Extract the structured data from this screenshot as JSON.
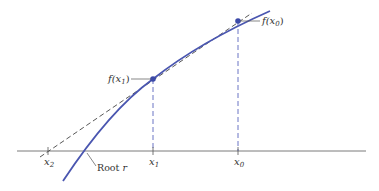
{
  "diagram": {
    "colors": {
      "curve": "#4a56b0",
      "axis": "#7a7a7a",
      "tangent": "#444444",
      "dashed_vertical": "#6b74c4",
      "point": "#3c4aa8",
      "text": "#333333"
    },
    "labels": {
      "f_x0_main": "f(x",
      "f_x0_sub": "0",
      "f_x0_close": ")",
      "f_x1_main": "f(x",
      "f_x1_sub": "1",
      "f_x1_close": ")",
      "x0_main": "x",
      "x0_sub": "0",
      "x1_main": "x",
      "x1_sub": "1",
      "x2_main": "x",
      "x2_sub": "2",
      "root_label": "Root ",
      "root_var": "r"
    }
  }
}
